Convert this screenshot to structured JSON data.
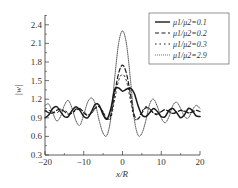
{
  "chart_data": {
    "type": "line",
    "title": "",
    "xlabel": "x/R",
    "ylabel": "|w|",
    "xlim": [
      -20,
      20
    ],
    "ylim": [
      0.3,
      2.55
    ],
    "xticks": [
      -20,
      -10,
      0,
      10,
      20
    ],
    "yticks": [
      0.3,
      0.6,
      0.9,
      1.2,
      1.5,
      1.8,
      2.1,
      2.4
    ],
    "grid": false,
    "legend_position": "upper right",
    "series": [
      {
        "name": "μ1/μ2=0.1",
        "style": "solid",
        "x": [
          -20,
          -19,
          -18,
          -17,
          -16,
          -15,
          -14,
          -13,
          -12,
          -11,
          -10,
          -9,
          -8,
          -7,
          -6,
          -5,
          -4,
          -3,
          -2,
          -1,
          0,
          1,
          2,
          3,
          4,
          5,
          6,
          7,
          8,
          9,
          10,
          11,
          12,
          13,
          14,
          15,
          16,
          17,
          18,
          19,
          20
        ],
        "values": [
          0.9,
          0.95,
          1.05,
          1.08,
          1.0,
          0.92,
          0.92,
          1.02,
          1.08,
          1.02,
          0.92,
          0.9,
          1.0,
          1.12,
          1.1,
          0.95,
          0.88,
          1.05,
          1.36,
          1.38,
          1.33,
          1.36,
          1.38,
          1.3,
          1.1,
          0.95,
          0.92,
          0.98,
          1.05,
          1.0,
          0.92,
          0.92,
          1.02,
          1.05,
          0.98,
          0.9,
          0.95,
          1.05,
          1.02,
          0.93,
          0.92
        ]
      },
      {
        "name": "μ1/μ2=0.2",
        "style": "dashed",
        "x": [
          -20,
          -19,
          -18,
          -17,
          -16,
          -15,
          -14,
          -13,
          -12,
          -11,
          -10,
          -9,
          -8,
          -7,
          -6,
          -5,
          -4,
          -3,
          -2,
          -1,
          0,
          1,
          2,
          3,
          4,
          5,
          6,
          7,
          8,
          9,
          10,
          11,
          12,
          13,
          14,
          15,
          16,
          17,
          18,
          19,
          20
        ],
        "values": [
          1.02,
          0.98,
          0.98,
          1.02,
          1.04,
          1.0,
          0.96,
          0.98,
          1.04,
          1.05,
          0.98,
          0.94,
          0.98,
          1.06,
          1.08,
          0.98,
          0.88,
          0.95,
          1.3,
          1.62,
          1.75,
          1.62,
          1.3,
          0.95,
          0.88,
          0.98,
          1.06,
          1.04,
          0.98,
          0.96,
          1.0,
          1.03,
          1.0,
          0.97,
          0.99,
          1.02,
          1.01,
          0.98,
          0.99,
          1.02,
          1.0
        ]
      },
      {
        "name": "μ1/μ2=0.3",
        "style": "dash-dot",
        "x": [
          -20,
          -19,
          -18,
          -17,
          -16,
          -15,
          -14,
          -13,
          -12,
          -11,
          -10,
          -9,
          -8,
          -7,
          -6,
          -5,
          -4,
          -3,
          -2,
          -1,
          0,
          1,
          2,
          3,
          4,
          5,
          6,
          7,
          8,
          9,
          10,
          11,
          12,
          13,
          14,
          15,
          16,
          17,
          18,
          19,
          20
        ],
        "values": [
          1.0,
          1.02,
          0.99,
          0.98,
          1.02,
          1.02,
          0.98,
          0.97,
          1.02,
          1.04,
          1.0,
          0.95,
          0.97,
          1.05,
          1.08,
          1.0,
          0.88,
          0.9,
          1.2,
          1.5,
          1.6,
          1.5,
          1.2,
          0.9,
          0.88,
          1.0,
          1.08,
          1.05,
          0.97,
          0.95,
          1.0,
          1.03,
          1.0,
          0.97,
          1.0,
          1.02,
          1.0,
          0.98,
          1.0,
          1.02,
          1.0
        ]
      },
      {
        "name": "μ1/μ2=2.9",
        "style": "dotted",
        "x": [
          -20,
          -19,
          -18,
          -17,
          -16,
          -15,
          -14,
          -13,
          -12,
          -11,
          -10,
          -9,
          -8,
          -7,
          -6,
          -5,
          -4,
          -3,
          -2,
          -1,
          0,
          1,
          2,
          3,
          4,
          5,
          6,
          7,
          8,
          9,
          10,
          11,
          12,
          13,
          14,
          15,
          16,
          17,
          18,
          19,
          20
        ],
        "values": [
          1.1,
          1.12,
          0.98,
          0.85,
          0.92,
          1.1,
          1.18,
          1.05,
          0.85,
          0.78,
          0.95,
          1.15,
          1.22,
          1.12,
          0.85,
          0.65,
          0.62,
          0.9,
          1.55,
          2.1,
          2.3,
          2.1,
          1.55,
          0.9,
          0.62,
          0.65,
          0.85,
          1.12,
          1.2,
          1.08,
          0.9,
          0.82,
          0.92,
          1.1,
          1.15,
          1.05,
          0.92,
          0.9,
          1.02,
          1.1,
          1.05
        ]
      }
    ]
  },
  "axes": {
    "xlabel": "x/R",
    "ylabel": "|w|",
    "xtick_labels": [
      "−20",
      "−10",
      "0",
      "10",
      "20"
    ],
    "ytick_labels": [
      "0.3",
      "0.6",
      "0.9",
      "1.2",
      "1.5",
      "1.8",
      "2.1",
      "2.4"
    ]
  },
  "legend": {
    "items": [
      {
        "label": "μ1/μ2=0.1",
        "style": "solid"
      },
      {
        "label": "μ1/μ2=0.2",
        "style": "dashed"
      },
      {
        "label": "μ1/μ2=0.3",
        "style": "dash-dot"
      },
      {
        "label": "μ1/μ2=2.9",
        "style": "dotted"
      }
    ]
  },
  "colors": {
    "line": "#1a1a1a",
    "axis": "#333333",
    "text": "#333333",
    "background": "#ffffff"
  }
}
